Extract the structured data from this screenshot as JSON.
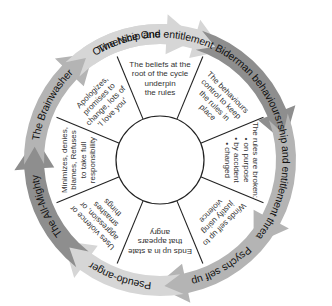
{
  "diagram": {
    "center": [
      160,
      160
    ],
    "inner_radius": 44,
    "wedge_radius": 112,
    "ring_inner": 112,
    "ring_outer": 140,
    "colors": {
      "arrow_light": "#d6d6d6",
      "arrow_mid": "#b4b4b4",
      "arrow_dark": "#8e8e8e",
      "divider": "#222222",
      "wedge_text": "#333333",
      "label_text": "#111111"
    },
    "arrows": [
      {
        "label": "Ownership and entitlement",
        "start_deg": -125,
        "end_deg": -60,
        "shade": "light"
      },
      {
        "label": "Biderman behaviours",
        "start_deg": -72,
        "end_deg": -8,
        "shade": "dark"
      },
      {
        "label": "Ownership and entitlement threatened",
        "start_deg": -20,
        "end_deg": 42,
        "shade": "mid"
      },
      {
        "label": "Psychs self up",
        "start_deg": 30,
        "end_deg": 92,
        "shade": "mid"
      },
      {
        "label": "Pseudo-anger",
        "start_deg": 80,
        "end_deg": 140,
        "shade": "light"
      },
      {
        "label": "The All-Mighty",
        "start_deg": 128,
        "end_deg": 190,
        "shade": "dark"
      },
      {
        "label": "The Brainwasher",
        "start_deg": 178,
        "end_deg": 238,
        "shade": "mid"
      },
      {
        "label": "The Nice One",
        "start_deg": 226,
        "end_deg": 287,
        "shade": "light"
      }
    ],
    "wedges": [
      {
        "center_deg": -90,
        "lines": [
          "The beliefs at the",
          "root of the cycle",
          "underpin",
          "the rules"
        ]
      },
      {
        "center_deg": -45,
        "lines": [
          "The behaviours",
          "control to keep",
          "the rules in",
          "place"
        ]
      },
      {
        "center_deg": 0,
        "lines": [
          "The rules are broken:",
          "• on purpose",
          "• by accident",
          "• changed"
        ]
      },
      {
        "center_deg": 45,
        "lines": [
          "Winds self up to",
          "justify using",
          "violence"
        ]
      },
      {
        "center_deg": 90,
        "lines": [
          "Ends up in a state",
          "that appears",
          "angry"
        ]
      },
      {
        "center_deg": 135,
        "lines": [
          "Uses violence or",
          "aggression, or",
          "smashes",
          "things"
        ]
      },
      {
        "center_deg": 180,
        "lines": [
          "Minimizes, denies,",
          "blames, Refuses",
          "to take full",
          "responsibility"
        ]
      },
      {
        "center_deg": 225,
        "lines": [
          "Apologizes,",
          "promises to",
          "change, lots of",
          "'I love you'"
        ]
      }
    ]
  }
}
